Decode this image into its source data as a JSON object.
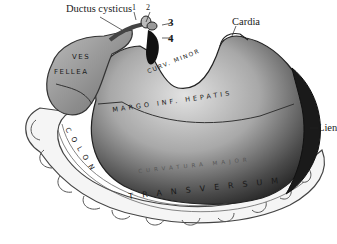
{
  "figure": {
    "labels": {
      "ductus_cysticus": "Ductus cysticus",
      "num_1": "1",
      "num_2": "2",
      "num_3": "3",
      "num_4": "4",
      "cardia": "Cardia",
      "ves": "VES",
      "fellea": "FELLEA",
      "curv_minor": "CURV. MINOR",
      "margo_inf_hepatis": "MARGO INF. HEPATIS",
      "curvatura_major": "CURVATURA MAJOR",
      "lien": "Lien",
      "colon": "COLON",
      "transversum": "TRANSVERSUM"
    },
    "colors": {
      "background": "#ffffff",
      "ink": "#1a1a1a",
      "stomach_light": "#c9c9c9",
      "stomach_dark": "#2a2a2a",
      "colon_fill": "#f4f4f4"
    }
  }
}
